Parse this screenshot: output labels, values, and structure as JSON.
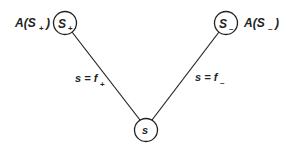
{
  "diagram": {
    "nodes": [
      {
        "id": "s_plus",
        "label": "S",
        "subscript": "+",
        "annotation": "A(S",
        "annotation_sub": "+",
        "annotation_close": ")"
      },
      {
        "id": "s_minus",
        "label": "S",
        "subscript": "–",
        "annotation": "A(S",
        "annotation_sub": "–",
        "annotation_close": ")"
      },
      {
        "id": "s",
        "label": "s"
      }
    ],
    "edges": [
      {
        "from": "s_plus",
        "to": "s",
        "label": "s = f",
        "label_sub": "+"
      },
      {
        "from": "s_minus",
        "to": "s",
        "label": "s = f",
        "label_sub": "–"
      }
    ],
    "colors": {
      "stroke": "#222222",
      "background": "#ffffff"
    }
  }
}
